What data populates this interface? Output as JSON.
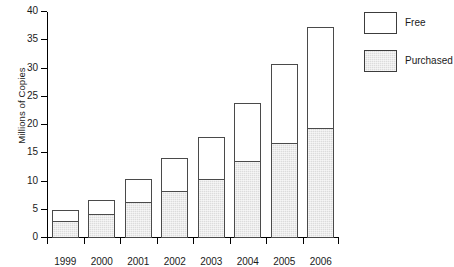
{
  "chart_data": {
    "type": "bar",
    "subtype": "stacked-vertical",
    "title": "",
    "xlabel": "",
    "ylabel": "Millions of Copies",
    "categories": [
      "1999",
      "2000",
      "2001",
      "2002",
      "2003",
      "2004",
      "2005",
      "2006"
    ],
    "series": [
      {
        "name": "Purchased",
        "color": "#dcdcdc",
        "values": [
          3.0,
          4.2,
          6.4,
          8.4,
          10.4,
          13.6,
          16.8,
          19.4
        ]
      },
      {
        "name": "Free",
        "color": "#ffffff",
        "values": [
          2.0,
          2.6,
          4.1,
          5.7,
          7.4,
          10.3,
          14.0,
          17.9
        ]
      }
    ],
    "totals": [
      5.0,
      6.8,
      10.5,
      14.1,
      17.8,
      23.9,
      30.8,
      37.3
    ],
    "ylim": [
      0,
      40
    ],
    "ytick_labels": [
      "0",
      "5",
      "10",
      "15",
      "20",
      "25",
      "30",
      "35",
      "40"
    ],
    "ytick_values": [
      0,
      5,
      10,
      15,
      20,
      25,
      30,
      35,
      40
    ],
    "ytick_step": 5,
    "grid": false,
    "legend_position": "top-right",
    "legend_entries": [
      "Free",
      "Purchased"
    ],
    "stack_order_bottom_to_top": [
      "Purchased",
      "Free"
    ]
  },
  "axes": {
    "y_title": "Millions of Copies"
  },
  "legend": {
    "items": [
      {
        "label": "Free",
        "swatch": "white-box"
      },
      {
        "label": "Purchased",
        "swatch": "gray-hatched-box"
      }
    ]
  }
}
